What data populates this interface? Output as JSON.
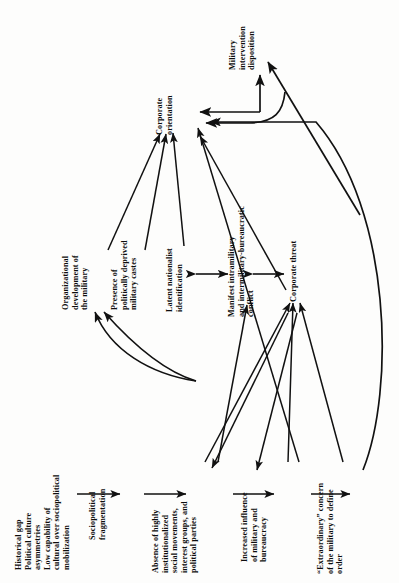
{
  "diagram": {
    "type": "causal-flow-diagram",
    "orientation": "rotated-90-ccw",
    "background_color": "#fdfdfc",
    "line_color": "#111111",
    "nodes": [
      {
        "id": "historical-gap",
        "lines": [
          "Historical gap",
          "Political culture",
          "asymmetries",
          "Low capability of",
          "cultural over sociopolitical",
          "mobilization"
        ]
      },
      {
        "id": "sociopolitical-fragmentation",
        "lines": [
          "Sociopolitical",
          "fragmentation"
        ]
      },
      {
        "id": "absence-institutionalized",
        "lines": [
          "Absence of highly",
          "institutionalized",
          "social movements,",
          "interest groups, and",
          "political parties"
        ]
      },
      {
        "id": "increased-influence",
        "lines": [
          "Increased influence",
          "of military and",
          "bureaucracy"
        ]
      },
      {
        "id": "extraordinary-concern",
        "lines": [
          "“Extraordinary” concern",
          "of the military to define",
          "order"
        ]
      },
      {
        "id": "organizational-development",
        "lines": [
          "Organizational",
          "development of",
          "the military"
        ]
      },
      {
        "id": "presence-deprived-castes",
        "lines": [
          "Presence of",
          "politically deprived",
          "military castes"
        ]
      },
      {
        "id": "latent-nationalist",
        "lines": [
          "Latent nationalist",
          "identification"
        ]
      },
      {
        "id": "manifest-conflict",
        "lines": [
          "Manifest intramilitary",
          "and intermilitary-bureaucratic",
          "conflict"
        ]
      },
      {
        "id": "corporate-threat",
        "lines": [
          "Corporate threat"
        ]
      },
      {
        "id": "corporate-orientation",
        "lines": [
          "Corporate",
          "orientation"
        ]
      },
      {
        "id": "military-intervention",
        "lines": [
          "Military",
          "intervention",
          "disposition"
        ]
      }
    ],
    "edges": [
      {
        "from": "historical-gap",
        "to": "sociopolitical-fragmentation",
        "style": "straight"
      },
      {
        "from": "sociopolitical-fragmentation",
        "to": "absence-institutionalized",
        "style": "straight"
      },
      {
        "from": "absence-institutionalized",
        "to": "increased-influence",
        "style": "straight"
      },
      {
        "from": "increased-influence",
        "to": "extraordinary-concern",
        "style": "straight"
      },
      {
        "from": "absence-institutionalized",
        "to": "manifest-conflict",
        "style": "straight"
      },
      {
        "from": "absence-institutionalized",
        "to": "corporate-threat",
        "style": "straight"
      },
      {
        "from": "increased-influence",
        "to": "corporate-threat",
        "style": "straight"
      },
      {
        "from": "increased-influence",
        "to": "corporate-orientation",
        "style": "straight"
      },
      {
        "from": "extraordinary-concern",
        "to": "corporate-threat",
        "style": "straight"
      },
      {
        "from": "extraordinary-concern",
        "to": "corporate-orientation",
        "style": "curved"
      },
      {
        "from": "corporate-threat",
        "to": "absence-institutionalized",
        "style": "straight"
      },
      {
        "from": "corporate-threat",
        "to": "increased-influence",
        "style": "straight"
      },
      {
        "from": "corporate-threat",
        "to": "corporate-orientation",
        "style": "straight"
      },
      {
        "from": "manifest-conflict",
        "to": "corporate-threat",
        "style": "double"
      },
      {
        "from": "latent-nationalist",
        "to": "manifest-conflict",
        "style": "double"
      },
      {
        "from": "latent-nationalist",
        "to": "corporate-orientation",
        "style": "straight"
      },
      {
        "from": "organizational-development",
        "to": "corporate-orientation",
        "style": "straight"
      },
      {
        "from": "presence-deprived-castes",
        "to": "corporate-orientation",
        "style": "straight"
      },
      {
        "from": "increased-influence",
        "to": "organizational-development",
        "style": "curved"
      },
      {
        "from": "increased-influence",
        "to": "latent-nationalist",
        "style": "curved"
      },
      {
        "from": "corporate-orientation",
        "to": "military-intervention",
        "style": "elbow"
      },
      {
        "from": "military-intervention",
        "to": "corporate-orientation",
        "style": "feedback-curve"
      }
    ]
  }
}
